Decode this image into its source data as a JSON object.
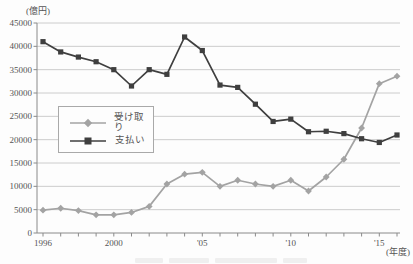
{
  "chart": {
    "y_unit_label": "(億円)",
    "x_unit_label": "(年度)"
  },
  "chart_data": {
    "type": "line",
    "title": "",
    "xlabel": "(年度)",
    "ylabel": "(億円)",
    "x": [
      1996,
      1997,
      1998,
      1999,
      2000,
      2001,
      2002,
      2003,
      2004,
      2005,
      2006,
      2007,
      2008,
      2009,
      2010,
      2011,
      2012,
      2013,
      2014,
      2015,
      2016
    ],
    "x_tick_labels": [
      {
        "year": 1996,
        "label": "1996"
      },
      {
        "year": 2000,
        "label": "2000"
      },
      {
        "year": 2005,
        "label": "'05"
      },
      {
        "year": 2010,
        "label": "'10"
      },
      {
        "year": 2015,
        "label": "'15"
      }
    ],
    "y_ticks": [
      0,
      5000,
      10000,
      15000,
      20000,
      25000,
      30000,
      35000,
      40000,
      45000
    ],
    "ylim": [
      0,
      45000
    ],
    "grid": "horizontal",
    "legend_position": "middle-left",
    "series": [
      {
        "name": "受け取り",
        "marker": "diamond",
        "color": "#a3a3a3",
        "values": [
          4900,
          5300,
          4800,
          3900,
          3900,
          4400,
          5700,
          10500,
          12600,
          13000,
          10000,
          11300,
          10500,
          10000,
          11300,
          9000,
          12000,
          15800,
          22500,
          32000,
          33600
        ]
      },
      {
        "name": "支払い",
        "marker": "square",
        "color": "#3f3f3f",
        "values": [
          41000,
          38800,
          37700,
          36700,
          35000,
          31500,
          35000,
          34000,
          42000,
          39100,
          31700,
          31200,
          27600,
          23900,
          24400,
          21700,
          21800,
          21300,
          20200,
          19400,
          21000
        ]
      }
    ]
  },
  "style": {
    "gridline_color": "#cccccc",
    "axis_color": "#8a8a8a",
    "text_color": "#555555"
  }
}
